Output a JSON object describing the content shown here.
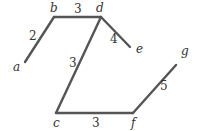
{
  "graph": {
    "nodes": [
      {
        "id": "a",
        "label": "a",
        "x": 25,
        "y": 62
      },
      {
        "id": "b",
        "label": "b",
        "x": 54,
        "y": 17
      },
      {
        "id": "d",
        "label": "d",
        "x": 101,
        "y": 17
      },
      {
        "id": "e",
        "label": "e",
        "x": 133,
        "y": 49
      },
      {
        "id": "c",
        "label": "c",
        "x": 56,
        "y": 113
      },
      {
        "id": "f",
        "label": "f",
        "x": 133,
        "y": 113
      },
      {
        "id": "g",
        "label": "g",
        "x": 179,
        "y": 76
      }
    ],
    "edges": [
      {
        "from": "a",
        "to": "b",
        "weight": "2"
      },
      {
        "from": "b",
        "to": "d",
        "weight": "3"
      },
      {
        "from": "d",
        "to": "e",
        "weight": "4"
      },
      {
        "from": "d",
        "to": "c",
        "weight": "3"
      },
      {
        "from": "c",
        "to": "f",
        "weight": "3"
      },
      {
        "from": "f",
        "to": "g",
        "weight": "5"
      }
    ]
  }
}
